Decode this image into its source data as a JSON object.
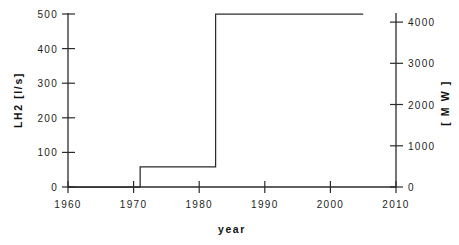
{
  "chart_data": {
    "type": "line",
    "title": "",
    "subtitle": "",
    "step": "post",
    "xlabel": "year",
    "ylabel": "LH2   [l/s]",
    "y2label": "[ M W ]",
    "xlim": [
      1960,
      2010
    ],
    "ylim": [
      0,
      500
    ],
    "y2lim": [
      0,
      4300
    ],
    "grid": false,
    "legend": null,
    "xticks": [
      1960,
      1970,
      1980,
      1990,
      2000,
      2010
    ],
    "xticklabels": [
      "1960",
      "1970",
      "1980",
      "1990",
      "2000",
      "2010"
    ],
    "yticks": [
      0,
      100,
      200,
      300,
      400,
      500
    ],
    "yticklabels": [
      "0",
      "100",
      "200",
      "300",
      "400",
      "500"
    ],
    "y2ticks": [
      0,
      1000,
      2000,
      3000,
      4000
    ],
    "y2ticklabels": [
      "0",
      "1000",
      "2000",
      "3000",
      "4000"
    ],
    "series": [
      {
        "name": "LH2 capacity",
        "x": [
          1960,
          1971,
          1971,
          1982.5,
          1982.5,
          2005
        ],
        "values": [
          0,
          0,
          58,
          58,
          500,
          500
        ],
        "units_left": "l/s",
        "units_right": "MW"
      }
    ],
    "annotations": []
  },
  "axes": {
    "left_unit": "l/s",
    "left_quantity": "LH2",
    "right_unit": "MW",
    "line_color": "#2b2b2b",
    "axis_color": "#2b2b2b",
    "background": "#ffffff"
  }
}
